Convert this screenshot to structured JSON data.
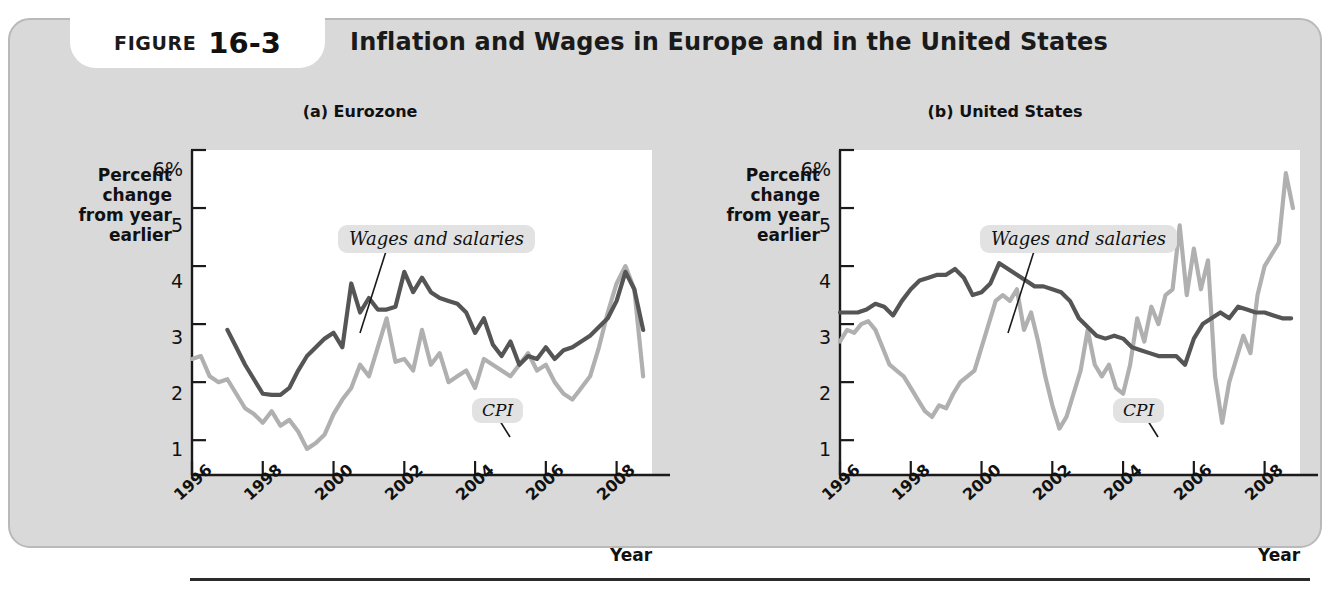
{
  "figure": {
    "label_word": "FIGURE",
    "number": "16-3",
    "title": "Inflation and Wages in Europe and in the United States"
  },
  "colors": {
    "card_bg": "#d9d9d9",
    "plot_bg": "#ffffff",
    "wages_line": "#555555",
    "cpi_line": "#b0b0b0",
    "axis": "#1a1a1a",
    "callout_bg": "#e2e2e2"
  },
  "panels": [
    {
      "id": "eurozone",
      "title": "(a) Eurozone",
      "y_caption": [
        "Percent",
        "change",
        "from year",
        "earlier"
      ],
      "x_caption": "Year",
      "y_ticks": [
        "6%",
        "5",
        "4",
        "3",
        "2",
        "1"
      ],
      "x_ticks": [
        "1996",
        "1998",
        "2000",
        "2002",
        "2004",
        "2006",
        "2008"
      ],
      "annotations": [
        {
          "name": "wages-and-salaries",
          "text": "Wages and salaries"
        },
        {
          "name": "cpi",
          "text": "CPI"
        }
      ]
    },
    {
      "id": "united-states",
      "title": "(b) United States",
      "y_caption": [
        "Percent",
        "change",
        "from year",
        "earlier"
      ],
      "x_caption": "Year",
      "y_ticks": [
        "6%",
        "5",
        "4",
        "3",
        "2",
        "1"
      ],
      "x_ticks": [
        "1996",
        "1998",
        "2000",
        "2002",
        "2004",
        "2006",
        "2008"
      ],
      "annotations": [
        {
          "name": "wages-and-salaries",
          "text": "Wages and salaries"
        },
        {
          "name": "cpi",
          "text": "CPI"
        }
      ]
    }
  ],
  "chart_data": [
    {
      "type": "line",
      "title": "(a) Eurozone",
      "xlabel": "Year",
      "ylabel": "Percent change from year earlier",
      "xlim": [
        1996.0,
        2009.0
      ],
      "ylim": [
        0.4,
        6.0
      ],
      "yticks": [
        1,
        2,
        3,
        4,
        5,
        6
      ],
      "xticks": [
        1996,
        1998,
        2000,
        2002,
        2004,
        2006,
        2008
      ],
      "grid": false,
      "legend": "annotations-inline",
      "series": [
        {
          "name": "Wages and salaries",
          "color": "#555555",
          "x": [
            1997.0,
            1997.25,
            1997.5,
            1997.75,
            1998.0,
            1998.25,
            1998.5,
            1998.75,
            1999.0,
            1999.25,
            1999.5,
            1999.75,
            2000.0,
            2000.25,
            2000.5,
            2000.75,
            2001.0,
            2001.25,
            2001.5,
            2001.75,
            2002.0,
            2002.25,
            2002.5,
            2002.75,
            2003.0,
            2003.25,
            2003.5,
            2003.75,
            2004.0,
            2004.25,
            2004.5,
            2004.75,
            2005.0,
            2005.25,
            2005.5,
            2005.75,
            2006.0,
            2006.25,
            2006.5,
            2006.75,
            2007.0,
            2007.25,
            2007.5,
            2007.75,
            2008.0,
            2008.25,
            2008.5,
            2008.75
          ],
          "y": [
            2.9,
            2.6,
            2.3,
            2.05,
            1.8,
            1.78,
            1.78,
            1.9,
            2.2,
            2.45,
            2.6,
            2.75,
            2.85,
            2.6,
            3.7,
            3.2,
            3.45,
            3.25,
            3.25,
            3.3,
            3.9,
            3.55,
            3.8,
            3.55,
            3.45,
            3.4,
            3.35,
            3.2,
            2.85,
            3.1,
            2.65,
            2.45,
            2.7,
            2.3,
            2.45,
            2.4,
            2.6,
            2.4,
            2.55,
            2.6,
            2.7,
            2.8,
            2.95,
            3.1,
            3.4,
            3.9,
            3.6,
            2.9
          ]
        },
        {
          "name": "CPI",
          "color": "#b0b0b0",
          "x": [
            1996.0,
            1996.25,
            1996.5,
            1996.75,
            1997.0,
            1997.25,
            1997.5,
            1997.75,
            1998.0,
            1998.25,
            1998.5,
            1998.75,
            1999.0,
            1999.25,
            1999.5,
            1999.75,
            2000.0,
            2000.25,
            2000.5,
            2000.75,
            2001.0,
            2001.25,
            2001.5,
            2001.75,
            2002.0,
            2002.25,
            2002.5,
            2002.75,
            2003.0,
            2003.25,
            2003.5,
            2003.75,
            2004.0,
            2004.25,
            2004.5,
            2004.75,
            2005.0,
            2005.25,
            2005.5,
            2005.75,
            2006.0,
            2006.25,
            2006.5,
            2006.75,
            2007.0,
            2007.25,
            2007.5,
            2007.75,
            2008.0,
            2008.25,
            2008.5,
            2008.75
          ],
          "y": [
            2.4,
            2.45,
            2.1,
            2.0,
            2.05,
            1.8,
            1.55,
            1.45,
            1.3,
            1.5,
            1.25,
            1.35,
            1.15,
            0.85,
            0.95,
            1.1,
            1.45,
            1.7,
            1.9,
            2.3,
            2.1,
            2.6,
            3.1,
            2.35,
            2.4,
            2.2,
            2.9,
            2.3,
            2.5,
            2.0,
            2.1,
            2.2,
            1.9,
            2.4,
            2.3,
            2.2,
            2.1,
            2.3,
            2.5,
            2.2,
            2.3,
            2.0,
            1.8,
            1.7,
            1.9,
            2.1,
            2.6,
            3.2,
            3.7,
            4.0,
            3.6,
            2.1
          ]
        }
      ]
    },
    {
      "type": "line",
      "title": "(b) United States",
      "xlabel": "Year",
      "ylabel": "Percent change from year earlier",
      "xlim": [
        1996.0,
        2009.0
      ],
      "ylim": [
        0.4,
        6.0
      ],
      "yticks": [
        1,
        2,
        3,
        4,
        5,
        6
      ],
      "xticks": [
        1996,
        1998,
        2000,
        2002,
        2004,
        2006,
        2008
      ],
      "grid": false,
      "legend": "annotations-inline",
      "series": [
        {
          "name": "Wages and salaries",
          "color": "#555555",
          "x": [
            1996.0,
            1996.25,
            1996.5,
            1996.75,
            1997.0,
            1997.25,
            1997.5,
            1997.75,
            1998.0,
            1998.25,
            1998.5,
            1998.75,
            1999.0,
            1999.25,
            1999.5,
            1999.75,
            2000.0,
            2000.25,
            2000.5,
            2000.75,
            2001.0,
            2001.25,
            2001.5,
            2001.75,
            2002.0,
            2002.25,
            2002.5,
            2002.75,
            2003.0,
            2003.25,
            2003.5,
            2003.75,
            2004.0,
            2004.25,
            2004.5,
            2004.75,
            2005.0,
            2005.25,
            2005.5,
            2005.75,
            2006.0,
            2006.25,
            2006.5,
            2006.75,
            2007.0,
            2007.25,
            2007.5,
            2007.75,
            2008.0,
            2008.25,
            2008.5,
            2008.75
          ],
          "y": [
            3.2,
            3.2,
            3.2,
            3.25,
            3.35,
            3.3,
            3.15,
            3.4,
            3.6,
            3.75,
            3.8,
            3.85,
            3.85,
            3.95,
            3.8,
            3.5,
            3.55,
            3.7,
            4.05,
            3.95,
            3.85,
            3.75,
            3.65,
            3.65,
            3.6,
            3.55,
            3.4,
            3.1,
            2.95,
            2.8,
            2.75,
            2.8,
            2.75,
            2.6,
            2.55,
            2.5,
            2.45,
            2.45,
            2.45,
            2.3,
            2.75,
            3.0,
            3.1,
            3.2,
            3.1,
            3.3,
            3.25,
            3.2,
            3.2,
            3.15,
            3.1,
            3.1
          ]
        },
        {
          "name": "CPI",
          "color": "#b0b0b0",
          "x": [
            1996.0,
            1996.2,
            1996.4,
            1996.6,
            1996.8,
            1997.0,
            1997.2,
            1997.4,
            1997.6,
            1997.8,
            1998.0,
            1998.2,
            1998.4,
            1998.6,
            1998.8,
            1999.0,
            1999.2,
            1999.4,
            1999.6,
            1999.8,
            2000.0,
            2000.2,
            2000.4,
            2000.6,
            2000.8,
            2001.0,
            2001.2,
            2001.4,
            2001.6,
            2001.8,
            2002.0,
            2002.2,
            2002.4,
            2002.6,
            2002.8,
            2003.0,
            2003.2,
            2003.4,
            2003.6,
            2003.8,
            2004.0,
            2004.2,
            2004.4,
            2004.6,
            2004.8,
            2005.0,
            2005.2,
            2005.4,
            2005.6,
            2005.8,
            2006.0,
            2006.2,
            2006.4,
            2006.6,
            2006.8,
            2007.0,
            2007.2,
            2007.4,
            2007.6,
            2007.8,
            2008.0,
            2008.2,
            2008.4,
            2008.6,
            2008.8
          ],
          "y": [
            2.7,
            2.9,
            2.85,
            3.0,
            3.05,
            2.9,
            2.6,
            2.3,
            2.2,
            2.1,
            1.9,
            1.7,
            1.5,
            1.4,
            1.6,
            1.55,
            1.8,
            2.0,
            2.1,
            2.2,
            2.6,
            3.0,
            3.4,
            3.5,
            3.4,
            3.6,
            2.9,
            3.2,
            2.7,
            2.1,
            1.6,
            1.2,
            1.4,
            1.8,
            2.2,
            2.9,
            2.3,
            2.1,
            2.3,
            1.9,
            1.8,
            2.3,
            3.1,
            2.7,
            3.3,
            3.0,
            3.5,
            3.6,
            4.7,
            3.5,
            4.3,
            3.6,
            4.1,
            2.1,
            1.3,
            2.0,
            2.4,
            2.8,
            2.5,
            3.5,
            4.0,
            4.2,
            4.4,
            5.6,
            5.0
          ]
        }
      ]
    }
  ]
}
